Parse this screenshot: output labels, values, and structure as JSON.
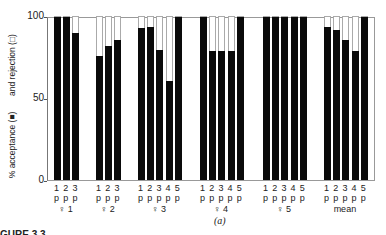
{
  "chart_data": {
    "type": "bar",
    "subtype": "stacked-100",
    "title": "",
    "ylabel_top": "and rejection (□)",
    "ylabel_bottom": "% acceptance (■)",
    "ylim": [
      0,
      100
    ],
    "yticks": [
      "0",
      "50",
      "100"
    ],
    "groups": [
      {
        "label": "♀ 1",
        "bars": [
          "1 p",
          "2 p",
          "3 p"
        ],
        "acceptance": [
          100,
          100,
          90
        ]
      },
      {
        "label": "♀ 2",
        "bars": [
          "1 p",
          "2 p",
          "3 p"
        ],
        "acceptance": [
          76,
          82,
          86
        ]
      },
      {
        "label": "♀ 3",
        "bars": [
          "1 p",
          "2 p",
          "3 p",
          "4 p",
          "5 p"
        ],
        "acceptance": [
          93,
          94,
          80,
          61,
          100
        ]
      },
      {
        "label": "♀ 4",
        "bars": [
          "1 p",
          "2 p",
          "3 p",
          "4 p",
          "5 p"
        ],
        "acceptance": [
          100,
          79,
          79,
          79,
          100
        ]
      },
      {
        "label": "♀ 5",
        "bars": [
          "1 p",
          "2 p",
          "3 p",
          "4 p",
          "5 p"
        ],
        "acceptance": [
          100,
          100,
          100,
          100,
          100
        ]
      },
      {
        "label": "mean",
        "bars": [
          "1 p",
          "2 p",
          "3 p",
          "4 p",
          "5 p"
        ],
        "acceptance": [
          94,
          92,
          86,
          79,
          100
        ]
      }
    ],
    "series": [
      {
        "name": "% acceptance",
        "color": "#0a0a0a"
      },
      {
        "name": "rejection",
        "color": "#ffffff"
      }
    ],
    "grid": false,
    "legend": "in y-axis label"
  },
  "caption": "(a)",
  "figure_label": "GURE 3.3"
}
